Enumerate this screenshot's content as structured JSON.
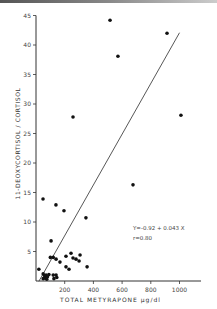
{
  "chart_data": {
    "type": "scatter",
    "title": "",
    "xlabel": "TOTAL METYRAPONE µg/dl",
    "ylabel": "11-DEOXYCORTISOL / CORTISOL",
    "xlim": [
      0,
      1150
    ],
    "ylim": [
      0,
      45
    ],
    "x_ticks": [
      200,
      400,
      600,
      800,
      1000
    ],
    "y_ticks": [
      5,
      10,
      15,
      20,
      25,
      30,
      35,
      40,
      45
    ],
    "grid": false,
    "legend": null,
    "regression": {
      "equation": "Y=-0.92 + 0.043 X",
      "r": "r=0.80",
      "intercept": -0.92,
      "slope": 0.043,
      "x_range": [
        20,
        1000
      ]
    },
    "points": [
      {
        "x": 516,
        "y": 44.2
      },
      {
        "x": 571,
        "y": 38.1
      },
      {
        "x": 913,
        "y": 42.0
      },
      {
        "x": 1010,
        "y": 28.1
      },
      {
        "x": 676,
        "y": 16.3
      },
      {
        "x": 258,
        "y": 27.8
      },
      {
        "x": 49,
        "y": 13.9
      },
      {
        "x": 139,
        "y": 12.9
      },
      {
        "x": 195,
        "y": 11.9
      },
      {
        "x": 348,
        "y": 10.7
      },
      {
        "x": 105,
        "y": 6.8
      },
      {
        "x": 100,
        "y": 4.0
      },
      {
        "x": 120,
        "y": 4.0
      },
      {
        "x": 140,
        "y": 3.7
      },
      {
        "x": 167,
        "y": 3.2
      },
      {
        "x": 209,
        "y": 4.2
      },
      {
        "x": 244,
        "y": 4.7
      },
      {
        "x": 258,
        "y": 3.9
      },
      {
        "x": 279,
        "y": 3.7
      },
      {
        "x": 307,
        "y": 4.4
      },
      {
        "x": 300,
        "y": 3.4
      },
      {
        "x": 356,
        "y": 2.4
      },
      {
        "x": 209,
        "y": 2.4
      },
      {
        "x": 230,
        "y": 2.0
      },
      {
        "x": 20,
        "y": 2.0
      },
      {
        "x": 50,
        "y": 1.2
      },
      {
        "x": 60,
        "y": 0.9
      },
      {
        "x": 70,
        "y": 1.0
      },
      {
        "x": 80,
        "y": 0.7
      },
      {
        "x": 60,
        "y": 0.5
      },
      {
        "x": 50,
        "y": 0.4
      },
      {
        "x": 90,
        "y": 1.1
      },
      {
        "x": 75,
        "y": 0.3
      },
      {
        "x": 120,
        "y": 1.0
      },
      {
        "x": 140,
        "y": 1.0
      },
      {
        "x": 125,
        "y": 0.4
      },
      {
        "x": 145,
        "y": 0.6
      }
    ]
  },
  "annotation": {
    "equation": "Y=-0.92 + 0.043 X",
    "r": "r=0.80"
  }
}
